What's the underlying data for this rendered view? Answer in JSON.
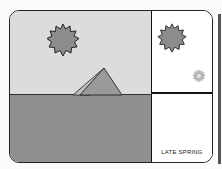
{
  "scene": {
    "sun_main": {
      "name": "sun",
      "color": "#8c8c8c"
    },
    "pyramid": {
      "name": "pyramid",
      "color": "#9a9a9a"
    },
    "sky_color": "#dcdcdc",
    "ground_color": "#8f8f8f"
  },
  "side_panel": {
    "upper": {
      "large_sun": "sun-large",
      "small_sun": "sun-small-faded"
    },
    "lower": {
      "label": "LATE SPRING"
    }
  }
}
